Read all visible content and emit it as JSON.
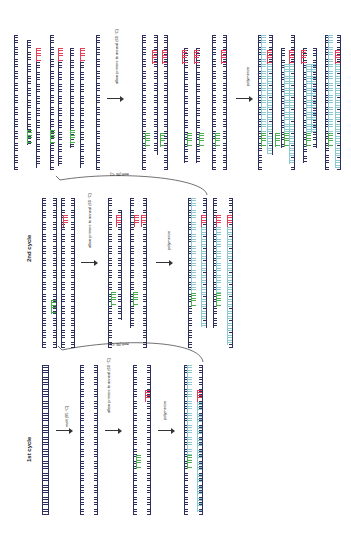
{
  "cycles": [
    {
      "title": "1st cycle"
    },
    {
      "title": "2nd cycle"
    }
  ],
  "steps": {
    "melt": "melt (95 °C)",
    "anneal": "allow primers to anneal (60 °C)",
    "polymerize": "polymerize"
  },
  "end_labels": {
    "five_prime": "5'",
    "three_prime": "3'"
  },
  "colors": {
    "template": "#2d2f5e",
    "forward_primer": "#4caf50",
    "reverse_primer": "#e0405a",
    "new_strand": "#8ec9d2"
  }
}
